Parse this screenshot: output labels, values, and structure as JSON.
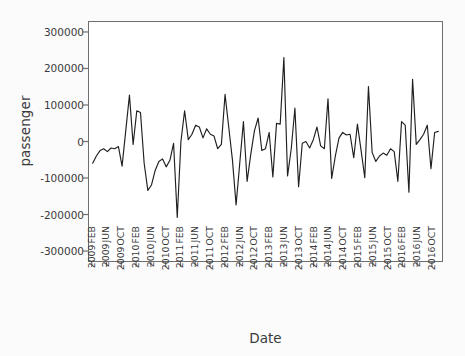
{
  "chart_data": {
    "type": "line",
    "title": "",
    "xlabel": "Date",
    "ylabel": "passenger",
    "ylim": [
      -330000,
      330000
    ],
    "yticks": [
      300000,
      200000,
      100000,
      0,
      -100000,
      -200000,
      -300000
    ],
    "ytick_labels": [
      "300000",
      "200000",
      "100000",
      "0",
      "-100000",
      "-200000",
      "-300000"
    ],
    "grid": false,
    "legend": null,
    "xtick_labels": [
      {
        "month": "FEB",
        "year": "2009"
      },
      {
        "month": "JUN",
        "year": "2009"
      },
      {
        "month": "OCT",
        "year": "2009"
      },
      {
        "month": "FEB",
        "year": "2010"
      },
      {
        "month": "JUN",
        "year": "2010"
      },
      {
        "month": "OCT",
        "year": "2010"
      },
      {
        "month": "FEB",
        "year": "2011"
      },
      {
        "month": "JUN",
        "year": "2011"
      },
      {
        "month": "OCT",
        "year": "2011"
      },
      {
        "month": "FEB",
        "year": "2012"
      },
      {
        "month": "JUN",
        "year": "2012"
      },
      {
        "month": "OCT",
        "year": "2012"
      },
      {
        "month": "FEB",
        "year": "2013"
      },
      {
        "month": "JUN",
        "year": "2013"
      },
      {
        "month": "OCT",
        "year": "2013"
      },
      {
        "month": "FEB",
        "year": "2014"
      },
      {
        "month": "JUN",
        "year": "2014"
      },
      {
        "month": "OCT",
        "year": "2014"
      },
      {
        "month": "FEB",
        "year": "2015"
      },
      {
        "month": "JUN",
        "year": "2015"
      },
      {
        "month": "OCT",
        "year": "2015"
      },
      {
        "month": "FEB",
        "year": "2016"
      },
      {
        "month": "JUN",
        "year": "2016"
      },
      {
        "month": "OCT",
        "year": "2016"
      }
    ],
    "x": [
      "FEB 2009",
      "MAR 2009",
      "APR 2009",
      "MAY 2009",
      "JUN 2009",
      "JUL 2009",
      "AUG 2009",
      "SEP 2009",
      "OCT 2009",
      "NOV 2009",
      "DEC 2009",
      "JAN 2010",
      "FEB 2010",
      "MAR 2010",
      "APR 2010",
      "MAY 2010",
      "JUN 2010",
      "JUL 2010",
      "AUG 2010",
      "SEP 2010",
      "OCT 2010",
      "NOV 2010",
      "DEC 2010",
      "JAN 2011",
      "FEB 2011",
      "MAR 2011",
      "APR 2011",
      "MAY 2011",
      "JUN 2011",
      "JUL 2011",
      "AUG 2011",
      "SEP 2011",
      "OCT 2011",
      "NOV 2011",
      "DEC 2011",
      "JAN 2012",
      "FEB 2012",
      "MAR 2012",
      "APR 2012",
      "MAY 2012",
      "JUN 2012",
      "JUL 2012",
      "AUG 2012",
      "SEP 2012",
      "OCT 2012",
      "NOV 2012",
      "DEC 2012",
      "JAN 2013",
      "FEB 2013",
      "MAR 2013",
      "APR 2013",
      "MAY 2013",
      "JUN 2013",
      "JUL 2013",
      "AUG 2013",
      "SEP 2013",
      "OCT 2013",
      "NOV 2013",
      "DEC 2013",
      "JAN 2014",
      "FEB 2014",
      "MAR 2014",
      "APR 2014",
      "MAY 2014",
      "JUN 2014",
      "JUL 2014",
      "AUG 2014",
      "SEP 2014",
      "OCT 2014",
      "NOV 2014",
      "DEC 2014",
      "JAN 2015",
      "FEB 2015",
      "MAR 2015",
      "APR 2015",
      "MAY 2015",
      "JUN 2015",
      "JUL 2015",
      "AUG 2015",
      "SEP 2015",
      "OCT 2015",
      "NOV 2015",
      "DEC 2015",
      "JAN 2016",
      "FEB 2016",
      "MAR 2016",
      "APR 2016",
      "MAY 2016",
      "JUN 2016",
      "JUL 2016",
      "AUG 2016",
      "SEP 2016",
      "OCT 2016",
      "NOV 2016",
      "DEC 2016"
    ],
    "values": [
      -60000,
      -40000,
      -25000,
      -20000,
      -28000,
      -18000,
      -20000,
      -14000,
      -68000,
      30000,
      128000,
      -8000,
      85000,
      80000,
      -60000,
      -135000,
      -120000,
      -80000,
      -55000,
      -48000,
      -70000,
      -52000,
      -5000,
      -210000,
      0,
      85000,
      5000,
      20000,
      45000,
      40000,
      10000,
      35000,
      20000,
      15000,
      -20000,
      -8000,
      130000,
      40000,
      -50000,
      -175000,
      -60000,
      55000,
      -110000,
      -35000,
      30000,
      65000,
      -25000,
      -20000,
      25000,
      -98000,
      50000,
      48000,
      232000,
      -95000,
      -20000,
      92000,
      -125000,
      -5000,
      0,
      -18000,
      5000,
      40000,
      -12000,
      -20000,
      118000,
      -102000,
      -40000,
      10000,
      25000,
      18000,
      20000,
      -45000,
      48000,
      -25000,
      -100000,
      152000,
      -30000,
      -55000,
      -40000,
      -32000,
      -38000,
      -20000,
      -28000,
      -110000,
      55000,
      45000,
      -140000,
      172000,
      -8000,
      5000,
      20000,
      45000,
      -75000,
      25000,
      28000
    ]
  }
}
